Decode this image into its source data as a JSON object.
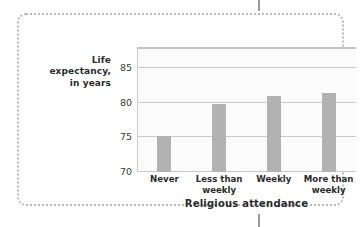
{
  "figure": {
    "frame_style": "dotted-rounded-border",
    "frame_color": "#b9b9b9",
    "background_color": "#ffffff",
    "crop_tick_color": "#9a9a9a"
  },
  "chart_data": {
    "type": "bar",
    "title": "",
    "subtitle": "",
    "categories": [
      "Never",
      "Less than weekly",
      "Weekly",
      "More than weekly"
    ],
    "category_lines": [
      [
        "Never"
      ],
      [
        "Less than",
        "weekly"
      ],
      [
        "Weekly"
      ],
      [
        "More than",
        "weekly"
      ]
    ],
    "values": [
      75.2,
      79.8,
      81.0,
      81.5
    ],
    "xlabel": "Religious attendance",
    "ylabel": "Life expectancy, in years",
    "ylabel_lines": [
      "Life",
      "expectancy,",
      "in years"
    ],
    "ylim": [
      70,
      87.8
    ],
    "yticks": [
      70,
      75,
      80,
      85
    ],
    "ytick_labels": [
      "70",
      "75",
      "80",
      "85"
    ],
    "grid": true,
    "grid_color": "#c9c9c9",
    "legend": false,
    "legend_position": "none",
    "bar_color": "#b2b2b2",
    "plot_background": "#fbfbfb",
    "axis_color": "#c2c2c2",
    "annotations": []
  }
}
